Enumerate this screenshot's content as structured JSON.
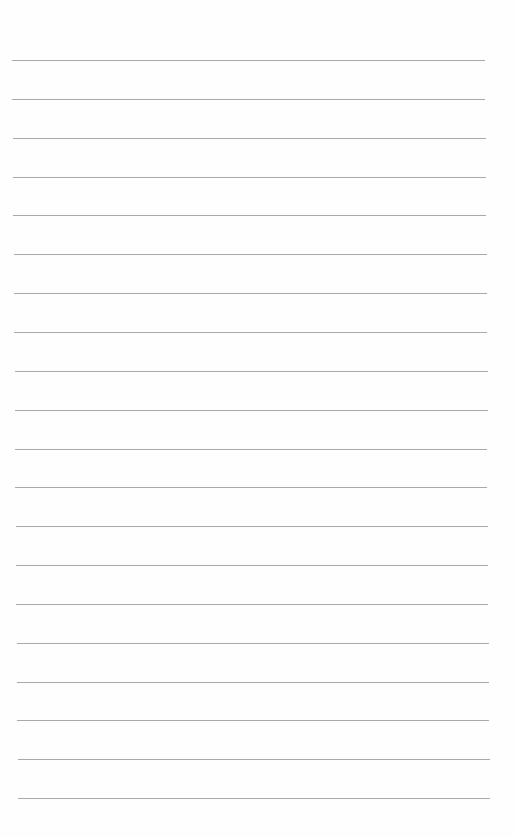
{
  "page": {
    "type": "lined-paper",
    "background": "#fefefe",
    "line_color": "#9a9a9a",
    "line_count": 20,
    "first_line_y": 60,
    "line_spacing": 38.85,
    "line_left_top": 12,
    "line_right_top": 485,
    "line_left_bottom": 18,
    "line_right_bottom": 490,
    "lines": [
      "",
      "",
      "",
      "",
      "",
      "",
      "",
      "",
      "",
      "",
      "",
      "",
      "",
      "",
      "",
      "",
      "",
      "",
      "",
      ""
    ]
  }
}
